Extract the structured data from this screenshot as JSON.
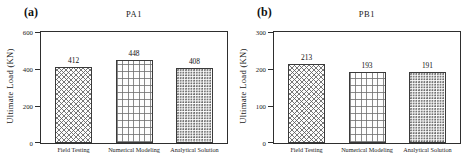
{
  "figure": {
    "background": "#ffffff",
    "axis_color": "#2e2e2e",
    "text_color": "#1a1a1a",
    "pattern_line_color": "#6b6b6b",
    "bar_fill": "#fdfdfd"
  },
  "chart_data": [
    {
      "type": "bar",
      "panel_label": "(a)",
      "title": "PA1",
      "xlabel": "",
      "ylabel": "Ultimate Load (KN)",
      "categories": [
        "Field Testing",
        "Numerical Modeling",
        "Analytical Solution"
      ],
      "values": [
        412,
        448,
        408
      ],
      "value_labels": [
        "412",
        "448",
        "408"
      ],
      "yticks": [
        0,
        200,
        400,
        600
      ],
      "ylim": [
        0,
        600
      ],
      "grid": false,
      "legend": "none",
      "bar_patterns": [
        "crosshatch",
        "grid",
        "dots"
      ]
    },
    {
      "type": "bar",
      "panel_label": "(b)",
      "title": "PB1",
      "xlabel": "",
      "ylabel": "Ultimate Load (KN)",
      "categories": [
        "Field Testing",
        "Numerical Modeling",
        "Analytical Solution"
      ],
      "values": [
        213,
        193,
        191
      ],
      "value_labels": [
        "213",
        "193",
        "191"
      ],
      "yticks": [
        0,
        100,
        200,
        300
      ],
      "ylim": [
        0,
        300
      ],
      "grid": false,
      "legend": "none",
      "bar_patterns": [
        "crosshatch",
        "grid",
        "dots"
      ]
    }
  ]
}
